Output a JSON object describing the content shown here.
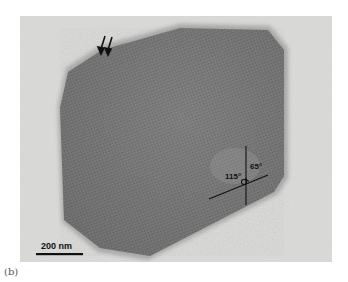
{
  "figure": {
    "panel_label": "(b)",
    "image_type": "TEM micrograph of hexagonal crystalline particle",
    "scale_bar": {
      "label": "200 nm"
    },
    "annotations": {
      "angle_obtuse": "115°",
      "angle_acute": "65°",
      "arrows": "double-arrow-icon"
    },
    "colors": {
      "background": "#d9d9d7",
      "particle": "#7b7b7b",
      "particle_dark": "#5e5e5e",
      "lines": "#111111"
    }
  }
}
